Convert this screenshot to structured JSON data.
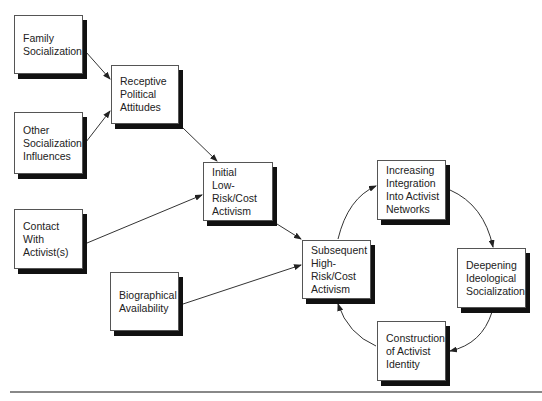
{
  "diagram": {
    "type": "flow-diagram",
    "nodes": [
      {
        "id": "family",
        "lines": [
          "Family",
          "Socialization"
        ],
        "x": 14,
        "y": 15,
        "w": 69,
        "h": 59
      },
      {
        "id": "receptive",
        "lines": [
          "Receptive",
          "Political",
          "Attitudes"
        ],
        "x": 111,
        "y": 65,
        "w": 68,
        "h": 59
      },
      {
        "id": "other",
        "lines": [
          "Other",
          "Socialization",
          "Influences"
        ],
        "x": 14,
        "y": 112,
        "w": 69,
        "h": 62
      },
      {
        "id": "initial",
        "lines": [
          "Initial",
          "Low-",
          "Risk/Cost",
          "Activism"
        ],
        "x": 203,
        "y": 162,
        "w": 70,
        "h": 59
      },
      {
        "id": "contact",
        "lines": [
          "Contact",
          "With",
          "Activist(s)"
        ],
        "x": 14,
        "y": 209,
        "w": 69,
        "h": 60
      },
      {
        "id": "biographical",
        "lines": [
          "Biographical",
          "Availability"
        ],
        "x": 110,
        "y": 272,
        "w": 69,
        "h": 59
      },
      {
        "id": "subsequent",
        "lines": [
          "Subsequent",
          "High-",
          "Risk/Cost",
          "Activism"
        ],
        "x": 302,
        "y": 240,
        "w": 69,
        "h": 59
      },
      {
        "id": "integration",
        "lines": [
          "Increasing",
          "Integration",
          "Into Activist",
          "Networks"
        ],
        "x": 377,
        "y": 160,
        "w": 69,
        "h": 60
      },
      {
        "id": "deepening",
        "lines": [
          "Deepening",
          "Ideological",
          "Socialization"
        ],
        "x": 457,
        "y": 248,
        "w": 69,
        "h": 60
      },
      {
        "id": "construction",
        "lines": [
          "Construction",
          "of Activist",
          "Identity"
        ],
        "x": 377,
        "y": 321,
        "w": 69,
        "h": 60
      }
    ],
    "edges": [
      {
        "from": "family",
        "to": "receptive",
        "kind": "straight"
      },
      {
        "from": "other",
        "to": "receptive",
        "kind": "straight"
      },
      {
        "from": "receptive",
        "to": "initial",
        "kind": "straight"
      },
      {
        "from": "contact",
        "to": "initial",
        "kind": "straight"
      },
      {
        "from": "initial",
        "to": "subsequent",
        "kind": "straight"
      },
      {
        "from": "biographical",
        "to": "subsequent",
        "kind": "straight"
      },
      {
        "from": "subsequent",
        "to": "integration",
        "kind": "curved"
      },
      {
        "from": "integration",
        "to": "deepening",
        "kind": "curved"
      },
      {
        "from": "deepening",
        "to": "construction",
        "kind": "curved"
      },
      {
        "from": "construction",
        "to": "subsequent",
        "kind": "curved"
      }
    ]
  }
}
